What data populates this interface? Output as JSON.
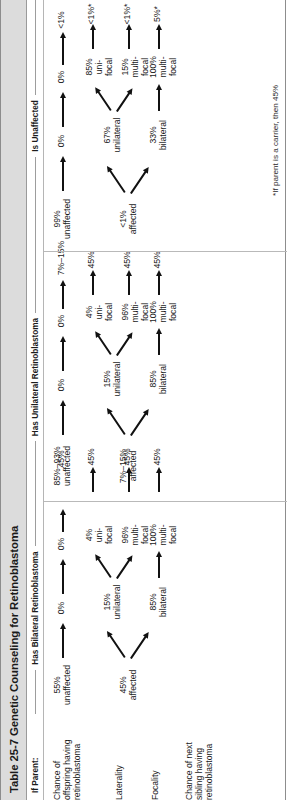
{
  "table": {
    "number": "Table 25-7",
    "title": "Genetic Counseling for Retinoblastoma",
    "full_title": "Table 25-7  Genetic Counseling for Retinoblastoma",
    "row_label_header": "If Parent:",
    "column_headers": [
      "Has Bilateral Retinoblastoma",
      "Has Unilateral Retinoblastoma",
      "Is Unaffected"
    ],
    "row_labels": [
      "Chance of\noffspring having\nretinoblastoma",
      "Laterality",
      "Focality",
      "Chance of next\nsibling having\nretinoblastoma"
    ],
    "footnote": "*If parent is a carrier, then 45%"
  },
  "columns": {
    "bilateral": {
      "header": "Has Bilateral Retinoblastoma",
      "affected": "45%\naffected",
      "unaffected": "55%\nunaffected",
      "unaffected_laterality": "0%",
      "unaffected_focality": "0%",
      "unaffected_sibling": "45%",
      "lat_bilateral": "85%\nbilateral",
      "lat_unilateral": "15%\nunilateral",
      "foc_from_bilateral": "100%\nmulti-\nfocal",
      "foc_uni_unifocal": "4%\nuni-\nfocal",
      "foc_uni_multifocal": "96%\nmulti-\nfocal",
      "sib_from_bilateral": "45%",
      "sib_uni_unifocal": "45%",
      "sib_uni_multifocal": "45%"
    },
    "unilateral": {
      "header": "Has Unilateral Retinoblastoma",
      "affected": "7%–15%\naffected",
      "unaffected": "85%–93%\nunaffected",
      "unaffected_laterality": "0%",
      "unaffected_focality": "0%",
      "unaffected_sibling": "7%–15%",
      "lat_bilateral": "85%\nbilateral",
      "lat_unilateral": "15%\nunilateral",
      "foc_from_bilateral": "100%\nmulti-\nfocal",
      "foc_uni_unifocal": "4%\nuni-\nfocal",
      "foc_uni_multifocal": "96%\nmulti-\nfocal",
      "sib_from_bilateral": "45%",
      "sib_uni_unifocal": "45%",
      "sib_uni_multifocal": "45%"
    },
    "unaffected": {
      "header": "Is Unaffected",
      "affected": "<1%\naffected",
      "unaffected": "99%\nunaffected",
      "unaffected_laterality": "0%",
      "unaffected_focality": "0%",
      "unaffected_sibling": "<1%",
      "lat_bilateral": "33%\nbilateral",
      "lat_unilateral": "67%\nunilateral",
      "foc_from_bilateral": "100%\nmulti-\nfocal",
      "foc_uni_unifocal": "85%\nuni-\nfocal",
      "foc_uni_multifocal": "15%\nmulti-\nfocal",
      "sib_from_bilateral": "5%*",
      "sib_uni_unifocal": "<1%*",
      "sib_uni_multifocal": "<1%*"
    }
  }
}
